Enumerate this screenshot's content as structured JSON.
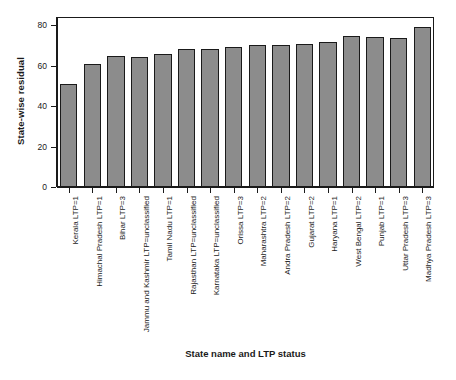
{
  "chart_data": {
    "type": "bar",
    "title": "",
    "xlabel": "State name and LTP status",
    "ylabel": "State-wise residual",
    "ylim": [
      0,
      84
    ],
    "yticks": [
      0,
      20,
      40,
      60,
      80
    ],
    "ytick_labels": [
      "0",
      "20",
      "40",
      "60",
      "80"
    ],
    "grid": false,
    "legend": "none",
    "bar_color": "#8c8c8c",
    "bar_edge_color": "#1a1a1a",
    "categories": [
      "Kerala LTP=1",
      "Himachal Pradesh LTP=1",
      "Bihar LTP=3",
      "Jammu and Kashmir LTP=unclassified",
      "Tamil Nadu LTP=1",
      "Rajasthan LTP=unclassified",
      "Karnataka LTP=unclassified",
      "Orissa LTP=3",
      "Maharashtra LTP=2",
      "Andra Pradesh LTP=2",
      "Gujarat LTP=2",
      "Haryana LTP=1",
      "West Bengal LTP=2",
      "Punjab LTP=1",
      "Uttar Pradesh LTP=3",
      "Madhya Pradesh LTP=3"
    ],
    "values": [
      51,
      61,
      64.5,
      64,
      65.5,
      68,
      68,
      69,
      70,
      70,
      70.5,
      71.5,
      74.5,
      74,
      73.5,
      79
    ]
  }
}
